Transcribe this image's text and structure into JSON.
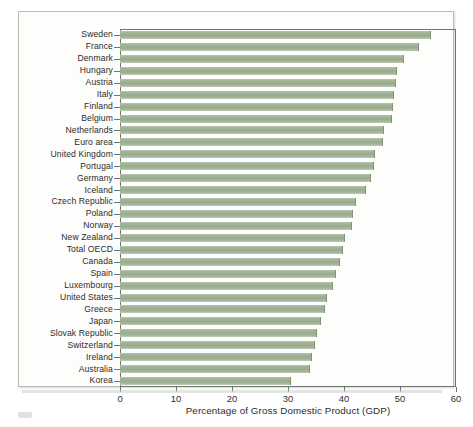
{
  "chart_data": {
    "type": "bar",
    "orientation": "horizontal",
    "title": "",
    "subtitle": "",
    "xlabel": "Percentage of Gross Domestic Product (GDP)",
    "ylabel": "",
    "xlim": [
      0,
      60
    ],
    "xticks": [
      0,
      10,
      20,
      30,
      40,
      50,
      60
    ],
    "xtick_labels": [
      "0",
      "10",
      "20",
      "30",
      "40",
      "50",
      "60"
    ],
    "grid": false,
    "legend": null,
    "bar_color": "#9cb293",
    "bar_edge_color": "#7e9275",
    "frame_color": "#6f7570",
    "background_color": "#fdfdfc",
    "categories": [
      "Sweden",
      "France",
      "Denmark",
      "Hungary",
      "Austria",
      "Italy",
      "Finland",
      "Belgium",
      "Netherlands",
      "Euro area",
      "United Kingdom",
      "Portugal",
      "Germany",
      "Iceland",
      "Czech Republic",
      "Poland",
      "Norway",
      "New Zealand",
      "Total OECD",
      "Canada",
      "Spain",
      "Luxembourg",
      "United States",
      "Greece",
      "Japan",
      "Slovak Republic",
      "Switzerland",
      "Ireland",
      "Australia",
      "Korea"
    ],
    "values": [
      55.6,
      53.4,
      50.8,
      49.5,
      49.3,
      49.0,
      48.7,
      48.5,
      47.2,
      47.0,
      45.6,
      45.4,
      44.9,
      43.9,
      42.1,
      41.6,
      41.4,
      40.2,
      39.9,
      39.3,
      38.5,
      38.1,
      36.9,
      36.6,
      35.9,
      35.2,
      34.8,
      34.2,
      33.9,
      30.5
    ]
  }
}
